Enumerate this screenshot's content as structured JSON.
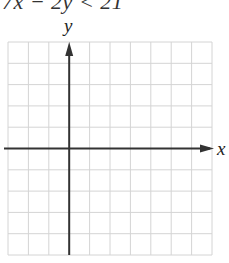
{
  "problem": {
    "inequality_text": "7x − 2y < 21"
  },
  "graph": {
    "x_axis_label": "x",
    "y_axis_label": "y",
    "grid": {
      "columns": 10,
      "rows": 10,
      "left": 8,
      "top": 42,
      "right": 212,
      "bottom": 255,
      "line_color": "#d4d4d4",
      "border_color": "#cfcfcf"
    },
    "origin": {
      "column_index": 3,
      "row_index": 5
    },
    "axis_color": "#333333"
  }
}
